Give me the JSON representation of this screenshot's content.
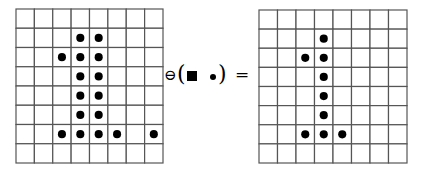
{
  "diagram": {
    "colors": {
      "grid_line": "#555555",
      "dot": "#000000",
      "background": "#ffffff"
    },
    "input_grid": {
      "rows": 8,
      "cols": 8,
      "cells": [
        [
          0,
          0,
          0,
          0,
          0,
          0,
          0,
          0
        ],
        [
          0,
          0,
          0,
          1,
          1,
          0,
          0,
          0
        ],
        [
          0,
          0,
          1,
          1,
          1,
          0,
          0,
          0
        ],
        [
          0,
          0,
          0,
          1,
          1,
          0,
          0,
          0
        ],
        [
          0,
          0,
          0,
          1,
          1,
          0,
          0,
          0
        ],
        [
          0,
          0,
          0,
          1,
          1,
          0,
          0,
          0
        ],
        [
          0,
          0,
          1,
          1,
          1,
          1,
          0,
          1
        ],
        [
          0,
          0,
          0,
          0,
          0,
          0,
          0,
          0
        ]
      ]
    },
    "operator": {
      "erosion_symbol": "⊖",
      "left_paren": "(",
      "structuring_element": [
        "origin-square",
        "dot"
      ],
      "right_paren": ")",
      "equals": "="
    },
    "output_grid": {
      "rows": 8,
      "cols": 8,
      "cells": [
        [
          0,
          0,
          0,
          0,
          0,
          0,
          0,
          0
        ],
        [
          0,
          0,
          0,
          1,
          0,
          0,
          0,
          0
        ],
        [
          0,
          0,
          1,
          1,
          0,
          0,
          0,
          0
        ],
        [
          0,
          0,
          0,
          1,
          0,
          0,
          0,
          0
        ],
        [
          0,
          0,
          0,
          1,
          0,
          0,
          0,
          0
        ],
        [
          0,
          0,
          0,
          1,
          0,
          0,
          0,
          0
        ],
        [
          0,
          0,
          1,
          1,
          1,
          0,
          0,
          0
        ],
        [
          0,
          0,
          0,
          0,
          0,
          0,
          0,
          0
        ]
      ]
    }
  }
}
